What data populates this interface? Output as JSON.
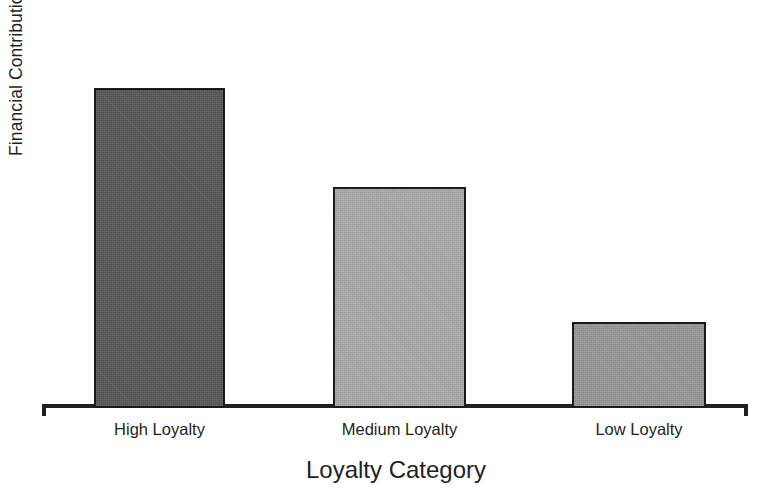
{
  "chart_data": {
    "type": "bar",
    "title": "",
    "xlabel": "Loyalty Category",
    "ylabel": "Financial Contributions by Customers",
    "categories": [
      "High Loyalty",
      "Medium Loyalty",
      "Low Loyalty"
    ],
    "values": [
      100,
      69,
      27
    ],
    "value_unit": "relative (unlabeled axis)",
    "ylim": [
      0,
      110
    ],
    "grid": false,
    "legend": null,
    "axis_tick_labels_y": [],
    "bar_colors": [
      "#585858",
      "#adadad",
      "#9a9a9a"
    ],
    "bar_border_color": "#1a1a1a",
    "axis_color": "#231f20",
    "background_color": "#ffffff"
  },
  "axis": {
    "y_title": "Financial Contributions by Customers",
    "x_title": "Loyalty Category"
  },
  "bars": [
    {
      "label": "High Loyalty",
      "value": 100,
      "color": "#585858"
    },
    {
      "label": "Medium Loyalty",
      "value": 69,
      "color": "#adadad"
    },
    {
      "label": "Low Loyalty",
      "value": 27,
      "color": "#9a9a9a"
    }
  ]
}
